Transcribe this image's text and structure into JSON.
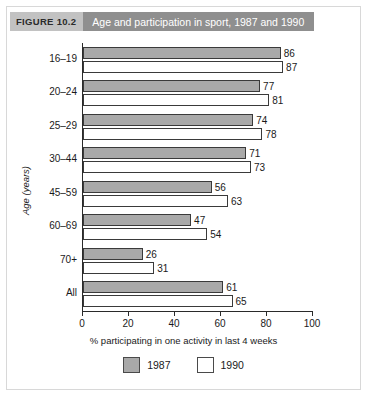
{
  "figure": {
    "tag": "FIGURE 10.2",
    "title": "Age and participation in sport, 1987 and 1990"
  },
  "legend": {
    "items": [
      {
        "label": "1987",
        "color": "#a9a9a9"
      },
      {
        "label": "1990",
        "color": "#ffffff"
      }
    ]
  },
  "chart_data": {
    "type": "bar",
    "orientation": "horizontal",
    "title": "Age and participation in sport, 1987 and 1990",
    "xlabel": "% participating in one activity in last 4 weeks",
    "ylabel": "Age (years)",
    "xlim": [
      0,
      100
    ],
    "xticks": [
      0,
      20,
      40,
      60,
      80,
      100
    ],
    "grid": false,
    "legend_position": "bottom",
    "categories": [
      "16–19",
      "20–24",
      "25–29",
      "30–44",
      "45–59",
      "60–69",
      "70+",
      "All"
    ],
    "series": [
      {
        "name": "1987",
        "color": "#a9a9a9",
        "values": [
          86,
          77,
          74,
          71,
          56,
          47,
          26,
          61
        ]
      },
      {
        "name": "1990",
        "color": "#ffffff",
        "values": [
          87,
          81,
          78,
          73,
          63,
          54,
          31,
          65
        ]
      }
    ]
  }
}
